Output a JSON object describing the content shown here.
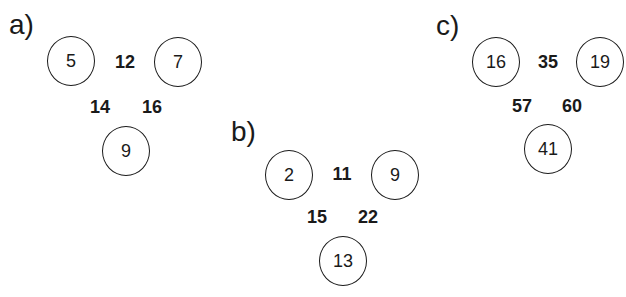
{
  "puzzles": [
    {
      "label": "a)",
      "circles": {
        "top_left": "5",
        "top_right": "7",
        "bottom": "9"
      },
      "sums": {
        "top": "12",
        "left": "14",
        "right": "16"
      }
    },
    {
      "label": "b)",
      "circles": {
        "top_left": "2",
        "top_right": "9",
        "bottom": "13"
      },
      "sums": {
        "top": "11",
        "left": "15",
        "right": "22"
      }
    },
    {
      "label": "c)",
      "circles": {
        "top_left": "16",
        "top_right": "19",
        "bottom": "41"
      },
      "sums": {
        "top": "35",
        "left": "57",
        "right": "60"
      }
    }
  ]
}
